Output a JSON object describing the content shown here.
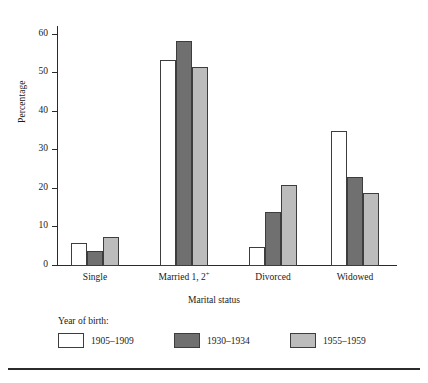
{
  "chart_data": {
    "type": "bar",
    "title": "",
    "xlabel": "Marital status",
    "ylabel": "Percentage",
    "categories": [
      "Single",
      "Married 1, 2+",
      "Divorced",
      "Widowed"
    ],
    "category_labels": [
      {
        "text": "Single",
        "sup": ""
      },
      {
        "text": "Married 1, 2",
        "sup": "+"
      },
      {
        "text": "Divorced",
        "sup": ""
      },
      {
        "text": "Widowed",
        "sup": ""
      }
    ],
    "series": [
      {
        "name": "1905–1909",
        "color": "#ffffff",
        "values": [
          6,
          53.5,
          5,
          35
        ]
      },
      {
        "name": "1930–1934",
        "color": "#707070",
        "values": [
          4,
          58.5,
          14,
          23
        ]
      },
      {
        "name": "1955–1959",
        "color": "#bcbcbc",
        "values": [
          7.5,
          51.5,
          21,
          19
        ]
      }
    ],
    "ylim": [
      0,
      62
    ],
    "yticks": [
      0,
      10,
      20,
      30,
      40,
      50,
      60
    ],
    "ytick_labels": [
      "0",
      "10",
      "20",
      "30",
      "40",
      "50",
      "60"
    ],
    "grid": false,
    "legend_position": "bottom-left",
    "legend_title": "Year of birth:"
  },
  "axis": {
    "y_title": "Percentage",
    "x_title": "Marital status"
  },
  "legend": {
    "title": "Year of birth:",
    "entries": [
      {
        "label": "1905–1909",
        "swatch": "s0"
      },
      {
        "label": "1930–1934",
        "swatch": "s1"
      },
      {
        "label": "1955–1959",
        "swatch": "s2"
      }
    ]
  }
}
